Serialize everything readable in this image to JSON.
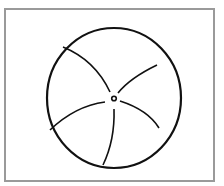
{
  "figure": {
    "frame_color": "#9a9a9a",
    "stroke_color": "#111111",
    "circle": {
      "cx": 114,
      "cy": 98,
      "rx": 67,
      "ry": 70
    },
    "center_ring": {
      "cx": 114,
      "cy": 98,
      "r": 2.5
    },
    "spoke_count": 5
  }
}
